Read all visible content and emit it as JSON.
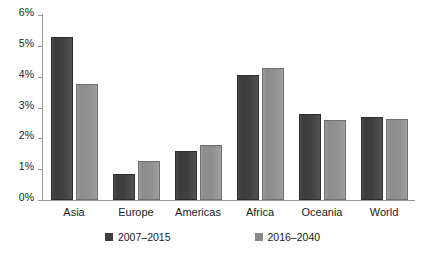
{
  "chart_data": {
    "type": "bar",
    "title": "",
    "subtitle": "",
    "xlabel": "",
    "ylabel": "",
    "ylim": [
      0,
      6
    ],
    "ytick_values": [
      0,
      1,
      2,
      3,
      4,
      5,
      6
    ],
    "ytick_labels": [
      "0%",
      "1%",
      "2%",
      "3%",
      "4%",
      "5%",
      "6%"
    ],
    "grid": false,
    "legend_position": "bottom",
    "categories": [
      "Asia",
      "Europe",
      "Americas",
      "Africa",
      "Oceania",
      "World"
    ],
    "series": [
      {
        "name": "2007–2015",
        "color": "#3d3d3d",
        "values": [
          5.3,
          0.85,
          1.6,
          4.05,
          2.78,
          2.7
        ]
      },
      {
        "name": "2016–2040",
        "color": "#8a8a8a",
        "values": [
          3.75,
          1.27,
          1.77,
          4.27,
          2.6,
          2.63
        ]
      }
    ]
  },
  "axis": {
    "line_color": "#9a9a9a"
  }
}
